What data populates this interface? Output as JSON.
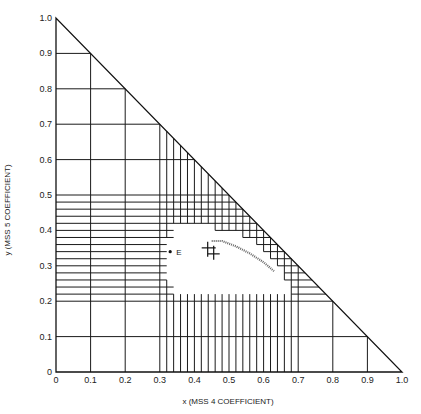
{
  "chart_data": {
    "type": "line",
    "title": "",
    "xlabel": "x (MSS 4 COEFFICIENT)",
    "ylabel": "y (MSS 5 COEFFICIENT)",
    "xlim": [
      0,
      1.0
    ],
    "ylim": [
      0,
      1.0
    ],
    "x_ticks": [
      "0",
      "0.1",
      "0.2",
      "0.3",
      "0.4",
      "0.5",
      "0.6",
      "0.7",
      "0.8",
      "0.9",
      "1.0"
    ],
    "y_ticks": [
      "0",
      "0.1",
      "0.2",
      "0.3",
      "0.4",
      "0.5",
      "0.6",
      "0.7",
      "0.8",
      "0.9",
      "1.0"
    ],
    "grid": true,
    "boundary": "triangle x + y = 1",
    "coarse_grid_step": 0.1,
    "fine_grid_step": 0.02,
    "fine_horizontal_band": [
      0.2,
      0.5
    ],
    "fine_vertical_band": [
      0.3,
      0.7
    ],
    "excluded_region_outline": [
      [
        0.34,
        0.22
      ],
      [
        0.34,
        0.26
      ],
      [
        0.32,
        0.26
      ],
      [
        0.32,
        0.38
      ],
      [
        0.34,
        0.38
      ],
      [
        0.34,
        0.42
      ],
      [
        0.44,
        0.42
      ],
      [
        0.46,
        0.4
      ],
      [
        0.52,
        0.4
      ],
      [
        0.54,
        0.38
      ],
      [
        0.56,
        0.38
      ],
      [
        0.58,
        0.36
      ],
      [
        0.6,
        0.34
      ],
      [
        0.62,
        0.32
      ],
      [
        0.64,
        0.3
      ],
      [
        0.66,
        0.28
      ],
      [
        0.66,
        0.26
      ],
      [
        0.68,
        0.24
      ],
      [
        0.68,
        0.22
      ]
    ],
    "annotations": [
      {
        "label": "E",
        "x": 0.33,
        "y": 0.34,
        "marker": "dot"
      },
      {
        "label": "",
        "x": 0.45,
        "y": 0.345,
        "marker": "double-cross"
      }
    ],
    "curve": {
      "name": "trajectory",
      "style": "dotted",
      "points": [
        [
          0.45,
          0.37
        ],
        [
          0.48,
          0.37
        ],
        [
          0.52,
          0.355
        ],
        [
          0.56,
          0.335
        ],
        [
          0.6,
          0.31
        ],
        [
          0.63,
          0.285
        ]
      ]
    }
  }
}
